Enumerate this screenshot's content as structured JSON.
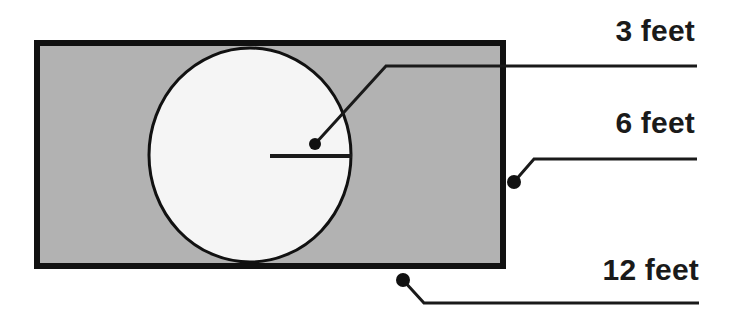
{
  "figure": {
    "type": "geometry-diagram",
    "width": 731,
    "height": 325,
    "colors": {
      "background": "#ffffff",
      "deck_fill": "#b2b2b2",
      "pool_fill": "#f5f5f5",
      "outline": "#111111",
      "leader": "#1a1a1a",
      "text": "#1a1a1a"
    }
  },
  "shapes": {
    "rectangle": {
      "name": "deck-rectangle",
      "x": 37,
      "y": 43,
      "width": 466,
      "height": 223,
      "fill": "#b2b2b2",
      "stroke": "#111111",
      "stroke_width": 6
    },
    "circle": {
      "name": "pool-circle",
      "cx": 250,
      "cy": 155,
      "rx": 101,
      "ry": 107,
      "fill": "#f5f5f5",
      "stroke": "#111111",
      "stroke_width": 3
    },
    "radius_line": {
      "name": "radius-line",
      "x1": 270,
      "y1": 156,
      "x2": 352,
      "y2": 156,
      "stroke": "#1a1a1a",
      "stroke_width": 4
    }
  },
  "leaders": [
    {
      "id": "leader-3feet",
      "target": "radius",
      "dot": {
        "x": 315,
        "y": 144,
        "r": 6
      },
      "bend": {
        "x": 386,
        "y": 66
      },
      "end": {
        "x": 697,
        "y": 66
      }
    },
    {
      "id": "leader-6feet",
      "target": "rectangle-height",
      "dot": {
        "x": 514,
        "y": 182,
        "r": 7
      },
      "bend": {
        "x": 534,
        "y": 159
      },
      "end": {
        "x": 697,
        "y": 159
      }
    },
    {
      "id": "leader-12feet",
      "target": "rectangle-width",
      "dot": {
        "x": 403,
        "y": 280,
        "r": 7
      },
      "bend": {
        "x": 424,
        "y": 303
      },
      "end": {
        "x": 699,
        "y": 303
      }
    }
  ],
  "labels": {
    "radius": "3 feet",
    "height": "6 feet",
    "width": "12 feet"
  },
  "chart_data": {
    "type": "diagram",
    "annotations": [
      {
        "label": "3 feet",
        "measures": "circle radius"
      },
      {
        "label": "6 feet",
        "measures": "rectangle height"
      },
      {
        "label": "12 feet",
        "measures": "rectangle width"
      }
    ],
    "values": [
      3,
      6,
      12
    ],
    "units": "feet"
  }
}
